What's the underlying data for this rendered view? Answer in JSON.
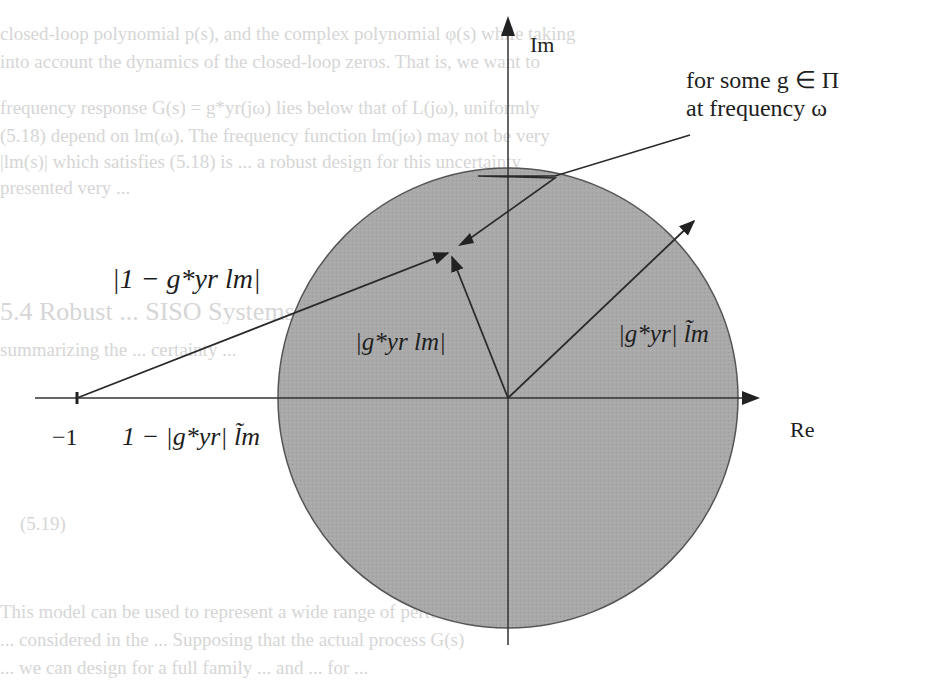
{
  "figure": {
    "axes": {
      "real_label": "Re",
      "imag_label": "Im",
      "origin": [
        508,
        398
      ],
      "real_axis_x_range": [
        35,
        760
      ],
      "imag_axis_y_range": [
        15,
        645
      ]
    },
    "disk": {
      "center": [
        508,
        398
      ],
      "radius": 230,
      "fill": "#a9a9a9",
      "stroke": "#555555"
    },
    "point_minus_one": {
      "label": "−1",
      "x": 77,
      "y": 398
    },
    "labels": {
      "one_minus_g_l": "|1 − g*yr lm|",
      "g_l": "|g*yr lm|",
      "g_ltilde": "|g*yr| l̃m",
      "one_minus_g_ltilde": "1 − |g*yr| l̃m",
      "annotation_line1": "for some g ∈ Π",
      "annotation_line2": "at frequency ω"
    },
    "vectors": [
      {
        "name": "from-minus-one",
        "from": [
          77,
          398
        ],
        "to": [
          450,
          252
        ]
      },
      {
        "name": "from-origin-to-point",
        "from": [
          508,
          398
        ],
        "to": [
          450,
          258
        ]
      },
      {
        "name": "from-origin-to-circle",
        "from": [
          508,
          398
        ],
        "to": [
          695,
          220
        ]
      },
      {
        "name": "annotation-pointer",
        "from": [
          690,
          135
        ],
        "to": [
          462,
          243
        ]
      }
    ],
    "line_color": "#2a2a2a"
  },
  "bleed_through_text": [
    "closed-loop polynomial p(s), and the complex polynomial φ(s) while taking",
    "into account the dynamics of the closed-loop zeros. That is, we want to",
    "frequency response G(s) = g*yr(jω) lies below that of L(jω), uniformly",
    "(5.18) depend on lm(ω). The frequency function lm(jω) may not be very",
    "|lm(s)| which satisfies (5.18) is ... a robust design for this uncertainty",
    "presented very ...",
    "5.4 Robust ... SISO Systems",
    "summarizing the ... certainty ...",
    "(5.19)",
    "This model can be used to represent a wide range of perturbed systems. ...",
    "... considered in the ... Supposing that the actual process G(s)",
    "... we can design for a full family ... and ... for ..."
  ]
}
